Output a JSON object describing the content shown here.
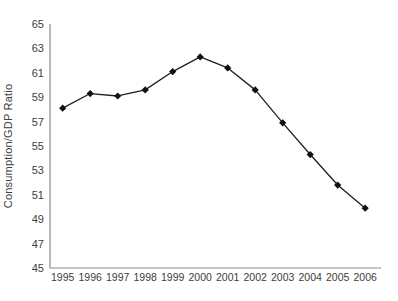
{
  "chart_data": {
    "type": "line",
    "title": "",
    "x": [
      1995,
      1996,
      1997,
      1998,
      1999,
      2000,
      2001,
      2002,
      2003,
      2004,
      2005,
      2006
    ],
    "series": [
      {
        "name": "Consumption/GDP Ratio",
        "values": [
          58.1,
          59.3,
          59.1,
          59.6,
          61.1,
          62.3,
          61.4,
          59.6,
          56.9,
          54.3,
          51.8,
          49.9
        ]
      }
    ],
    "xlabel": "",
    "ylabel": "Consumption/GDP Ratio",
    "ylim": [
      45,
      65
    ],
    "ytick_step": 2,
    "yticks": [
      45,
      47,
      49,
      51,
      53,
      55,
      57,
      59,
      61,
      63,
      65
    ],
    "grid": false,
    "legend_position": "none",
    "marker": "diamond",
    "colors": {
      "line": "#1f1f1f",
      "marker": "#111111",
      "axis": "#8c8c8c",
      "tick_text": "#404040",
      "background": "#ffffff"
    }
  }
}
